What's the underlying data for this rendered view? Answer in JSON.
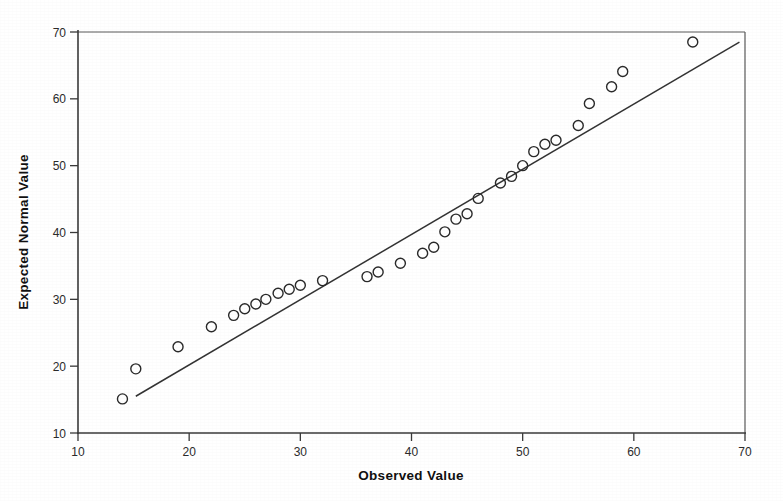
{
  "chart_data": {
    "type": "scatter",
    "title": "",
    "subtitle": "",
    "xlabel": "Observed Value",
    "ylabel": "Expected Normal Value",
    "xlim": [
      10,
      70
    ],
    "ylim": [
      10,
      70
    ],
    "xticks": [
      10,
      20,
      30,
      40,
      50,
      60,
      70
    ],
    "yticks": [
      10,
      20,
      30,
      40,
      50,
      60,
      70
    ],
    "xtick_labels": [
      "10",
      "20",
      "30",
      "40",
      "50",
      "60",
      "70"
    ],
    "ytick_labels": [
      "10",
      "20",
      "30",
      "40",
      "50",
      "60",
      "70"
    ],
    "grid": false,
    "legend": false,
    "legend_position": "none",
    "marker": "open-circle",
    "marker_size": 5,
    "series": [
      {
        "name": "Expected Normal Value",
        "x": [
          14.0,
          15.2,
          19.0,
          22.0,
          24.0,
          25.0,
          26.0,
          26.9,
          28.0,
          29.0,
          30.0,
          32.0,
          36.0,
          37.0,
          39.0,
          41.0,
          42.0,
          43.0,
          44.0,
          45.0,
          46.0,
          48.0,
          49.0,
          50.0,
          51.0,
          52.0,
          53.0,
          55.0,
          56.0,
          58.0,
          59.0,
          65.3
        ],
        "y": [
          15.1,
          19.6,
          22.9,
          25.9,
          27.6,
          28.6,
          29.3,
          30.0,
          30.9,
          31.5,
          32.1,
          32.8,
          33.4,
          34.1,
          35.4,
          36.9,
          37.8,
          40.1,
          42.0,
          42.8,
          45.1,
          47.4,
          48.4,
          50.0,
          52.1,
          53.2,
          53.8,
          56.0,
          59.3,
          61.8,
          64.1,
          68.5
        ]
      }
    ],
    "reference_line": {
      "name": "normal-reference-line",
      "x_start": 15.2,
      "y_start": 15.5,
      "x_end": 69.5,
      "y_end": 68.5
    }
  },
  "chart": {
    "xlabel": "Observed Value",
    "ylabel": "Expected Normal Value"
  },
  "colors": {
    "axis": "#3a3a3a",
    "frame": "#5a5a5a",
    "marker_stroke": "#2a2a2a",
    "reference_line": "#333333",
    "background": "#ffffff",
    "text": "#1a1a1a"
  }
}
